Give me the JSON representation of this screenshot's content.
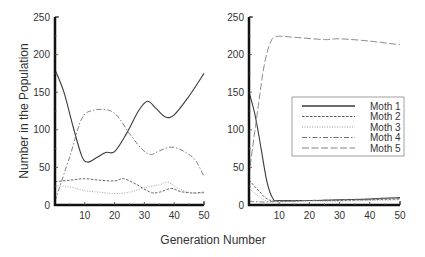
{
  "chart_data": {
    "type": "line",
    "shared_xlabel": "Generation Number",
    "shared_ylabel": "Number in the Population",
    "legend": [
      "Moth 1",
      "Moth 2",
      "Moth 3",
      "Moth 4",
      "Moth 5"
    ],
    "panels": [
      {
        "name": "left",
        "xlim": [
          0,
          50
        ],
        "ylim": [
          0,
          250
        ],
        "xticks": [
          10,
          20,
          30,
          40,
          50
        ],
        "yticks": [
          0,
          50,
          100,
          150,
          200,
          250
        ],
        "series": [
          {
            "name": "Moth 1",
            "style": "solid",
            "x": [
              0,
              3,
              6,
              9,
              11,
              14,
              17,
              20,
              24,
              28,
              31,
              34,
              37,
              40,
              45,
              50
            ],
            "y": [
              180,
              150,
              105,
              65,
              57,
              63,
              70,
              71,
              95,
              125,
              138,
              128,
              117,
              120,
              145,
              175
            ]
          },
          {
            "name": "Moth 2",
            "style": "dashed",
            "x": [
              0,
              5,
              10,
              15,
              20,
              23,
              27,
              32,
              35,
              39,
              42,
              46,
              50
            ],
            "y": [
              31,
              33,
              35,
              33,
              32,
              35,
              28,
              17,
              17,
              22,
              18,
              16,
              17
            ]
          },
          {
            "name": "Moth 3",
            "style": "dotted",
            "x": [
              0,
              5,
              10,
              15,
              20,
              25,
              30,
              35,
              38,
              42,
              46,
              50
            ],
            "y": [
              26,
              24,
              19,
              17,
              15,
              17,
              23,
              27,
              30,
              21,
              16,
              16
            ]
          },
          {
            "name": "Moth 4",
            "style": "dashdot",
            "x": [
              0,
              5,
              9,
              13,
              18,
              21,
              25,
              29,
              32,
              35,
              39,
              43,
              47,
              50
            ],
            "y": [
              5,
              65,
              115,
              126,
              126,
              118,
              95,
              75,
              67,
              72,
              77,
              72,
              60,
              38
            ]
          }
        ]
      },
      {
        "name": "right",
        "xlim": [
          0,
          50
        ],
        "ylim": [
          0,
          250
        ],
        "xticks": [
          10,
          20,
          30,
          40,
          50
        ],
        "yticks": [
          0,
          50,
          100,
          150,
          200,
          250
        ],
        "legend_position": "center-right",
        "series": [
          {
            "name": "Moth 1",
            "style": "solid",
            "x": [
              0,
              2,
              4,
              6,
              8,
              10,
              20,
              30,
              40,
              50
            ],
            "y": [
              150,
              120,
              75,
              30,
              8,
              6,
              6,
              7,
              8,
              10
            ]
          },
          {
            "name": "Moth 2",
            "style": "dashed",
            "x": [
              0,
              3,
              6,
              10,
              20,
              30,
              40,
              50
            ],
            "y": [
              33,
              20,
              8,
              5,
              6,
              6,
              7,
              8
            ]
          },
          {
            "name": "Moth 3",
            "style": "dotted",
            "x": [
              0,
              3,
              6,
              10,
              20,
              30,
              40,
              50
            ],
            "y": [
              22,
              12,
              5,
              4,
              5,
              5,
              6,
              7
            ]
          },
          {
            "name": "Moth 4",
            "style": "dashdot",
            "x": [
              0,
              5,
              10,
              20,
              30,
              40,
              50
            ],
            "y": [
              5,
              4,
              5,
              6,
              7,
              8,
              9
            ]
          },
          {
            "name": "Moth 5",
            "style": "longdash",
            "x": [
              0,
              3,
              5,
              7,
              9,
              15,
              25,
              30,
              40,
              50
            ],
            "y": [
              40,
              130,
              185,
              215,
              224,
              223,
              220,
              221,
              218,
              213
            ]
          }
        ]
      }
    ]
  },
  "labels": {
    "xlabel": "Generation Number",
    "ylabel": "Number in the Population"
  },
  "legend": {
    "items": [
      "Moth 1",
      "Moth 2",
      "Moth 3",
      "Moth 4",
      "Moth 5"
    ]
  }
}
